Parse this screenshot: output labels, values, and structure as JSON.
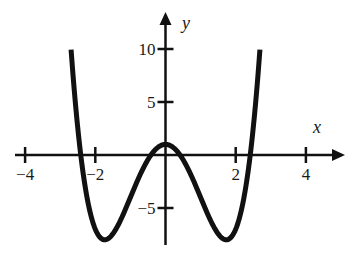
{
  "chart_data": {
    "type": "line",
    "title": "",
    "xlabel": "x",
    "ylabel": "y",
    "function": "y = x^4 - 6x^2 + 1",
    "xlim": [
      -4.2,
      5.1
    ],
    "ylim": [
      -8.5,
      13.5
    ],
    "x_ticks": [
      -4,
      -2,
      2,
      4
    ],
    "x_tick_labels": [
      "−4",
      "−2",
      "2",
      "4"
    ],
    "y_ticks": [
      10,
      5,
      -5
    ],
    "y_tick_labels": [
      "10",
      "5",
      "−5"
    ],
    "grid": false,
    "legend": null,
    "series": [
      {
        "name": "f(x)",
        "x_range": [
          -2.69,
          2.69
        ],
        "key_points": [
          {
            "x": -2.69,
            "y": 10.0,
            "note": "curve start"
          },
          {
            "x": -2.414,
            "y": 0,
            "note": "root"
          },
          {
            "x": -1.732,
            "y": -8,
            "note": "local minimum"
          },
          {
            "x": -0.414,
            "y": 0,
            "note": "root"
          },
          {
            "x": 0,
            "y": 1,
            "note": "local maximum"
          },
          {
            "x": 0.414,
            "y": 0,
            "note": "root"
          },
          {
            "x": 1.732,
            "y": -8,
            "note": "local minimum"
          },
          {
            "x": 2.414,
            "y": 0,
            "note": "root"
          },
          {
            "x": 2.69,
            "y": 10.0,
            "note": "curve end"
          }
        ]
      }
    ]
  },
  "layout": {
    "origin_px": [
      165.5,
      155
    ],
    "x_scale_px": 35.1,
    "y_scale_px": 10.6,
    "x_axis_px": [
      15,
      345
    ],
    "y_axis_px": [
      245,
      12
    ],
    "stroke_color": "#111111",
    "curve_width": 5
  }
}
